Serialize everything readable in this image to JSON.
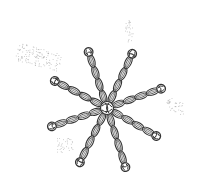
{
  "illustration": {
    "subject": "rope star with eight knotted arms",
    "colors": {
      "background": "#ffffff",
      "ink": "#333333",
      "rope_fill": "#ffffff",
      "stipple": "#9a9a9a"
    },
    "center": [
      107,
      108
    ],
    "arm_ends": [
      [
        88,
        50
      ],
      [
        133,
        52
      ],
      [
        163,
        88
      ],
      [
        158,
        137
      ],
      [
        126,
        169
      ],
      [
        79,
        164
      ],
      [
        50,
        127
      ],
      [
        53,
        80
      ]
    ],
    "stipple_patches": [
      {
        "x": 16,
        "y": 48,
        "w": 46,
        "h": 18,
        "rot": 15
      },
      {
        "x": 125,
        "y": 20,
        "w": 8,
        "h": 22,
        "rot": 0
      },
      {
        "x": 166,
        "y": 100,
        "w": 20,
        "h": 12,
        "rot": 20
      },
      {
        "x": 57,
        "y": 138,
        "w": 16,
        "h": 14,
        "rot": 0
      }
    ]
  }
}
